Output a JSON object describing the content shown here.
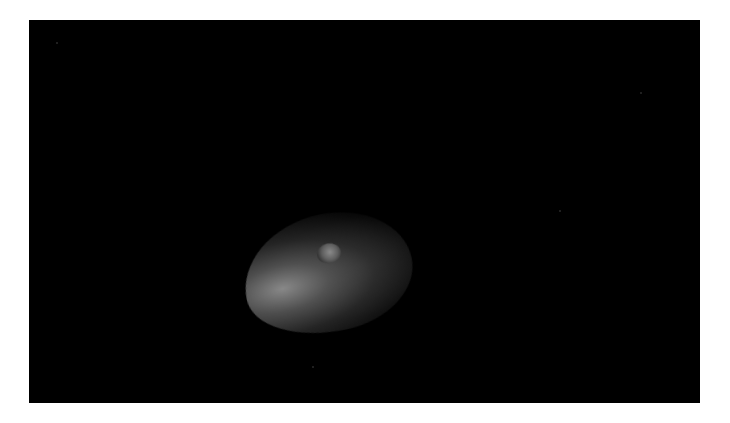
{
  "image": {
    "subject": "asteroid",
    "description": "Irregularly shaped, cratered asteroid partially illuminated from the left against a black space background",
    "background_color": "#000000",
    "frame_color": "#ffffff",
    "features": [
      "crater-near-top-center",
      "illuminated-left-limb",
      "shadowed-right-side"
    ]
  }
}
